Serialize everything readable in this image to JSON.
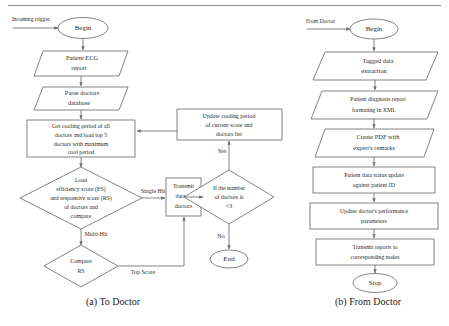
{
  "figure": {
    "caption_a": "(a) To Doctor",
    "caption_b": "(b) From Doctor"
  },
  "diagram_a": {
    "title": "To Doctor",
    "external_labels": [
      {
        "id": "incoming-trigger",
        "text": "Incoming trigger"
      }
    ],
    "nodes": [
      {
        "id": "a-begin",
        "type": "terminator",
        "text": "Begin"
      },
      {
        "id": "a-ecg",
        "type": "io",
        "line1": "Patient ECG",
        "line2": "report"
      },
      {
        "id": "a-parse",
        "type": "io",
        "line1": "Parse doctors",
        "line2": "database"
      },
      {
        "id": "a-cool",
        "type": "process",
        "line1": "Get cooling period of all",
        "line2": "doctors and load top 5",
        "line3": "doctors with maximum",
        "line4": "cool period"
      },
      {
        "id": "a-load",
        "type": "decision",
        "line1": "Load",
        "line2": "efficiency score (ES)",
        "line3": "and responsive score (RS)",
        "line4": "of doctors and",
        "line5": "compare"
      },
      {
        "id": "a-transmit",
        "type": "process",
        "line1": "Transmit",
        "line2": "data to",
        "line3": "doctors"
      },
      {
        "id": "a-compare",
        "type": "decision",
        "line1": "Compare",
        "line2": "RS"
      },
      {
        "id": "a-update",
        "type": "process",
        "line1": "Update cooling period",
        "line2": "of current score and",
        "line3": "doctors list"
      },
      {
        "id": "a-ifnum",
        "type": "decision",
        "line1": "If the number",
        "line2": "of doctors is",
        "line3": "<3"
      },
      {
        "id": "a-end",
        "type": "terminator",
        "text": "End"
      }
    ],
    "edge_labels": [
      {
        "id": "a-single-hit",
        "text": "Single Hit"
      },
      {
        "id": "a-multi-hit",
        "text": "Multi-Hit"
      },
      {
        "id": "a-top-score",
        "text": "Top Score"
      },
      {
        "id": "a-yes",
        "text": "Yes"
      },
      {
        "id": "a-no",
        "text": "No"
      }
    ]
  },
  "diagram_b": {
    "title": "From Doctor",
    "external_labels": [
      {
        "id": "from-doctor",
        "text": "From Doctor"
      }
    ],
    "nodes": [
      {
        "id": "b-begin",
        "type": "terminator",
        "text": "Begin"
      },
      {
        "id": "b-tagged",
        "type": "io",
        "line1": "Tagged data",
        "line2": "extraction"
      },
      {
        "id": "b-diagnosis",
        "type": "io",
        "line1": "Patient diagnosis report",
        "line2": "formating in XML"
      },
      {
        "id": "b-pdf",
        "type": "io",
        "line1": "Create PDF with",
        "line2": "expert's remarks"
      },
      {
        "id": "b-status",
        "type": "process",
        "line1": "Patient data status update",
        "line2": "against patient ID"
      },
      {
        "id": "b-perf",
        "type": "process",
        "line1": "Update doctor's performance",
        "line2": "parameters"
      },
      {
        "id": "b-reports",
        "type": "process",
        "line1": "Transmit reports to",
        "line2": "corresponding nodes"
      },
      {
        "id": "b-stop",
        "type": "terminator",
        "text": "Stop"
      }
    ]
  },
  "colors": {
    "stroke": "#6e6e6e",
    "text": "#2b2b2b",
    "background": "#ffffff",
    "rule": "#8c8c8c"
  }
}
